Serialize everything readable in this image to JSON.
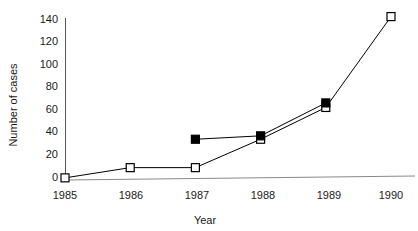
{
  "chart_data": {
    "type": "line",
    "title": "",
    "subtitle": "",
    "xlabel": "Year",
    "ylabel": "Number of cases",
    "categories": [
      "1985",
      "1986",
      "1987",
      "1988",
      "1989",
      "1990"
    ],
    "x": [
      1985,
      1986,
      1987,
      1988,
      1989,
      1990
    ],
    "xlim": [
      1985,
      1990
    ],
    "ylim": [
      0,
      140
    ],
    "yticks": [
      0,
      20,
      40,
      60,
      80,
      100,
      120,
      140
    ],
    "ytick_labels": [
      "0",
      "20",
      "40",
      "60",
      "80",
      "100",
      "120",
      "140"
    ],
    "xtick_labels": [
      "1985",
      "1986",
      "1987",
      "1988",
      "1989",
      "1990"
    ],
    "grid": false,
    "legend": "none",
    "series": [
      {
        "name": "open-square-series",
        "marker": "open-square",
        "x": [
          1985,
          1986,
          1987,
          1988,
          1989,
          1990
        ],
        "values": [
          1,
          10,
          10,
          35,
          63,
          143
        ]
      },
      {
        "name": "filled-square-series",
        "marker": "filled-square",
        "x": [
          1987,
          1988,
          1989
        ],
        "values": [
          35,
          38,
          67
        ]
      }
    ],
    "annotations": []
  },
  "axes": {
    "y_title": "Number of cases",
    "x_title": "Year",
    "y_ticks": [
      "140",
      "120",
      "100",
      "80",
      "60",
      "40",
      "20",
      "0"
    ],
    "x_ticks": [
      "1985",
      "1986",
      "1987",
      "1988",
      "1989",
      "1990"
    ]
  },
  "colors": {
    "line": "#000000",
    "marker_open_fill": "#ffffff",
    "marker_filled_fill": "#000000",
    "axis": "#555555",
    "baseline": "#8a8a8a",
    "text": "#1a1a1a",
    "background": "#ffffff"
  }
}
